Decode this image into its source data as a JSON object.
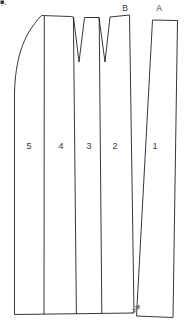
{
  "diagram": {
    "type": "technical-line-drawing",
    "background_color": "#ffffff",
    "line_color": "#231f20",
    "text_color": "#3a3a3a",
    "marker_color": "#6a6a6a",
    "panels": [
      {
        "id": "panel-5",
        "label": "5",
        "label_x": 29,
        "label_y": 149
      },
      {
        "id": "panel-4",
        "label": "4",
        "label_x": 61,
        "label_y": 149
      },
      {
        "id": "panel-3",
        "label": "3",
        "label_x": 89,
        "label_y": 149
      },
      {
        "id": "panel-2",
        "label": "2",
        "label_x": 115,
        "label_y": 149
      },
      {
        "id": "panel-1",
        "label": "1",
        "label_x": 155,
        "label_y": 149
      }
    ],
    "reference_points": [
      {
        "id": "ref-b",
        "label": "B",
        "label_x": 125,
        "label_y": 11
      },
      {
        "id": "ref-a",
        "label": "A",
        "label_x": 159,
        "label_y": 11
      }
    ],
    "darts": [
      {
        "id": "dart-left",
        "apex_x": 79,
        "apex_y": 62
      },
      {
        "id": "dart-right",
        "apex_x": 105,
        "apex_y": 62
      }
    ],
    "annotation": {
      "id": "pivot-arrow",
      "x": 134,
      "y": 310,
      "description": "arrow marker at lower right pivot point"
    }
  }
}
